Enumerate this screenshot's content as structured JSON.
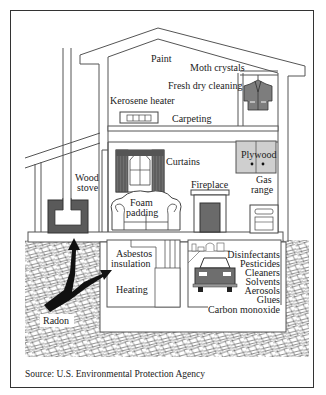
{
  "diagram": {
    "type": "indoor air pollution sources in a house (cross-section)",
    "labels": {
      "paint": "Paint",
      "moth_crystals": "Moth crystals",
      "fresh_dry_cleaning": "Fresh dry cleaning",
      "kerosene_heater": "Kerosene heater",
      "carpeting": "Carpeting",
      "curtains": "Curtains",
      "plywood": "Plywood",
      "wood_stove_1": "Wood",
      "wood_stove_2": "stove",
      "gas_range_1": "Gas",
      "gas_range_2": "range",
      "fireplace": "Fireplace",
      "foam_padding_1": "Foam",
      "foam_padding_2": "padding",
      "asbestos_1": "Asbestos",
      "asbestos_2": "insulation",
      "heating": "Heating",
      "disinfectants": "Disinfectants",
      "pesticides": "Pesticides",
      "cleaners": "Cleaners",
      "solvents": "Solvents",
      "aerosols": "Aerosols",
      "glues": "Glues",
      "carbon_monoxide": "Carbon monoxide",
      "radon": "Radon"
    },
    "source": "Source: U.S. Environmental Protection Agency"
  },
  "colors": {
    "line": "#555555",
    "dark_fill": "#5a5a5a",
    "mid_fill": "#8a8a8a",
    "light_fill": "#cfcfcf",
    "arrow": "#111111"
  }
}
